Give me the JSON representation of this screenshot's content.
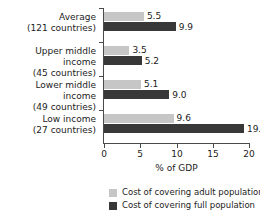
{
  "chart_data": {
    "type": "bar",
    "orientation": "horizontal",
    "title": "",
    "xlabel": "% of GDP",
    "ylabel": "",
    "xlim": [
      0,
      20
    ],
    "xticks": [
      0,
      5,
      10,
      15,
      20
    ],
    "xtick_labels": [
      "0",
      "5",
      "10",
      "15",
      "20"
    ],
    "grid": false,
    "legend_position": "bottom",
    "categories": [
      {
        "line1": "Average",
        "line2": "(121 countries)"
      },
      {
        "line1": "Upper middle income",
        "line2": "(45 countries)"
      },
      {
        "line1": "Lower middle income",
        "line2": "(49 countries)"
      },
      {
        "line1": "Low income",
        "line2": "(27 countries)"
      }
    ],
    "series": [
      {
        "name": "Cost of covering adult population",
        "color": "#c6c6c6",
        "values": [
          5.5,
          3.5,
          5.1,
          9.6
        ],
        "labels": [
          "5.5",
          "3.5",
          "5.1",
          "9.6"
        ]
      },
      {
        "name": "Cost of covering full population",
        "color": "#383838",
        "values": [
          9.9,
          5.2,
          9.0,
          19.3
        ],
        "labels": [
          "9.9",
          "5.2",
          "9.0",
          "19.3"
        ]
      }
    ]
  },
  "axis": {
    "x_title": "% of GDP",
    "tick_0": "0",
    "tick_1": "5",
    "tick_2": "10",
    "tick_3": "15",
    "tick_4": "20"
  },
  "legend": {
    "items": [
      {
        "label": "Cost of covering adult population",
        "color": "#c6c6c6"
      },
      {
        "label": "Cost of covering full population",
        "color": "#383838"
      }
    ]
  }
}
